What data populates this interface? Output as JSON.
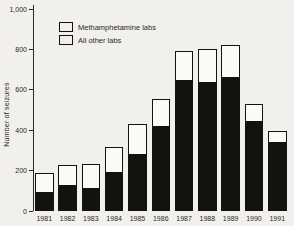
{
  "figure": {
    "background_color": "#f1f0ed",
    "bar_black_color": "#14120f",
    "bar_white_color": "#fbfaf7"
  },
  "chart_data": {
    "type": "bar",
    "stacked": true,
    "title": "",
    "xlabel": "",
    "ylabel": "Number of seizures",
    "ylim": [
      0,
      1000
    ],
    "grid": false,
    "legend_position": "top-left-inside",
    "categories": [
      "1981",
      "1982",
      "1983",
      "1984",
      "1985",
      "1986",
      "1987",
      "1988",
      "1989",
      "1990",
      "1991"
    ],
    "series": [
      {
        "name": "Methamphetamine labs",
        "color": "#14120f",
        "values": [
          95,
          130,
          115,
          190,
          280,
          420,
          645,
          635,
          660,
          445,
          340
        ]
      },
      {
        "name": "All other labs",
        "color": "#fbfaf7",
        "values": [
          95,
          100,
          120,
          125,
          150,
          135,
          145,
          165,
          160,
          85,
          55
        ]
      }
    ],
    "stacked_totals": [
      190,
      230,
      235,
      315,
      430,
      555,
      790,
      800,
      820,
      530,
      395
    ],
    "yticks": [
      {
        "v": 0,
        "label": "0"
      },
      {
        "v": 200,
        "label": "200"
      },
      {
        "v": 400,
        "label": "400"
      },
      {
        "v": 600,
        "label": "600"
      },
      {
        "v": 800,
        "label": "800"
      },
      {
        "v": 1000,
        "label": "1,000"
      }
    ]
  }
}
